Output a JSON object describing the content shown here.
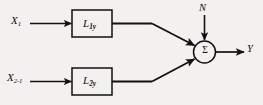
{
  "diagram": {
    "background_color": "#f2f1ef",
    "stroke_color": "#111111",
    "inputs": [
      {
        "id": "x1",
        "base": "X",
        "subscript": "1"
      },
      {
        "id": "x2",
        "base": "X",
        "subscript": "2-1"
      }
    ],
    "blocks": [
      {
        "id": "block1",
        "base": "L",
        "subscript": "1y"
      },
      {
        "id": "block2",
        "base": "L",
        "subscript": "2y"
      }
    ],
    "summer": {
      "symbol": "Σ",
      "noise_label": "N"
    },
    "output": {
      "label": "Y"
    }
  }
}
